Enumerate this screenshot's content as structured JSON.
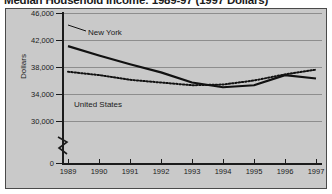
{
  "chart_data": {
    "type": "line",
    "title": "Median Household Income: 1989-97 (1997 Dollars)",
    "xlabel": "",
    "ylabel": "Dollars",
    "x": [
      1989,
      1990,
      1991,
      1992,
      1993,
      1994,
      1995,
      1996,
      1997
    ],
    "categories": [
      "1989",
      "1990",
      "1991",
      "1992",
      "1993",
      "1994",
      "1995",
      "1996",
      "1997"
    ],
    "ytick_labels": [
      "0",
      "30,000",
      "34,000",
      "38,000",
      "42,000",
      "46,000"
    ],
    "ytick_values": [
      0,
      30000,
      34000,
      38000,
      42000,
      46000
    ],
    "ylim": [
      30000,
      46000
    ],
    "axis_break": true,
    "grid": true,
    "legend_position": "inline-annotations",
    "series": [
      {
        "name": "New York",
        "style": "solid",
        "color": "#111111",
        "values": [
          41100,
          39700,
          38400,
          37200,
          35700,
          35000,
          35300,
          36800,
          36300
        ]
      },
      {
        "name": "United States",
        "style": "dotted",
        "color": "#111111",
        "values": [
          37300,
          36800,
          36100,
          35700,
          35300,
          35400,
          36000,
          36900,
          37600
        ]
      }
    ]
  },
  "annotations": {
    "new_york_label": "New York",
    "united_states_label": "United States"
  }
}
